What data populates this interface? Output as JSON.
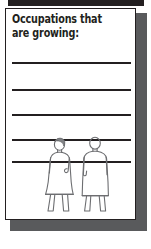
{
  "page": {
    "background_color": "#ffffff",
    "top_bleed_bar_color": "#231f20"
  },
  "card": {
    "title": "Occupations that are growing:",
    "border_color": "#231f20",
    "background_color": "#ffffff",
    "shadow_color": "#595a5c"
  },
  "ruled_lines": {
    "count": 5,
    "color": "#231f20",
    "positions": [
      {
        "label": "answer-line-1",
        "top": 53
      },
      {
        "label": "answer-line-2",
        "top": 80
      },
      {
        "label": "answer-line-3",
        "top": 105
      },
      {
        "label": "answer-line-4",
        "top": 130
      },
      {
        "label": "answer-line-5",
        "top": 152
      }
    ]
  },
  "illustration": {
    "name": "two-standing-people",
    "stroke_color": "#6d6e71",
    "hair_shade_color": "#808285",
    "figures": [
      {
        "name": "figure-left-person-with-hair",
        "has_hair": true
      },
      {
        "name": "figure-right-person",
        "has_hair": false
      }
    ]
  }
}
